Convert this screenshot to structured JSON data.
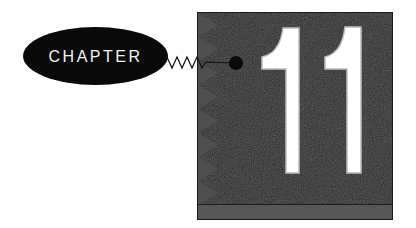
{
  "chapter": {
    "label": "CHAPTER",
    "number": "11"
  },
  "colors": {
    "ellipse": "#0a0a0a",
    "ellipse_text": "#f2f2f2",
    "box_background": "#2d2d2d",
    "box_teeth": "#505050",
    "bottom_band": "#575757",
    "numeral_fill": "#ffffff",
    "numeral_outline": "#bdbdbd",
    "connector": "#111111"
  },
  "icons": {
    "connector": "zigzag-line-with-dot",
    "edge": "sawtooth-triangles"
  }
}
